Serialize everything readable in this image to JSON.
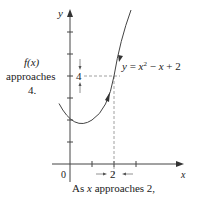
{
  "figure": {
    "function_label": "y = x² − x + 2",
    "function_label_parts": {
      "prefix": "y = x",
      "exp": "2",
      "suffix": " − x + 2"
    },
    "y_axis_label": "y",
    "x_axis_label": "x",
    "origin_label": "0",
    "x_marker_label": "2",
    "y_marker_label": "4",
    "left_annotation": {
      "line1": "f(x)",
      "line2": "approaches",
      "line3": "4."
    },
    "bottom_caption": "As x approaches 2,",
    "caption_parts": {
      "before": "As ",
      "var": "x",
      "after": " approaches 2,"
    },
    "colors": {
      "axis": "#333333",
      "curve": "#444444",
      "dashed": "#888888",
      "text": "#222222"
    }
  }
}
